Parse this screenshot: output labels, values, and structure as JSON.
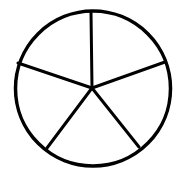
{
  "diagram": {
    "type": "divided-circle",
    "sections": 5,
    "stroke_color": "#000000",
    "background_color": "#ffffff",
    "circle": {
      "cx": 93,
      "cy": 88.5,
      "r": 77.5,
      "stroke_width": 3.5
    },
    "center": {
      "x": 92,
      "y": 88
    },
    "spokes": [
      {
        "x": 91,
        "y": 12
      },
      {
        "x": 165,
        "y": 62
      },
      {
        "x": 139,
        "y": 147
      },
      {
        "x": 47,
        "y": 148
      },
      {
        "x": 18,
        "y": 63
      }
    ]
  }
}
